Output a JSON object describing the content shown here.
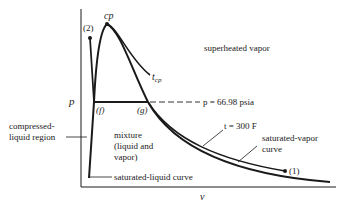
{
  "diagram": {
    "type": "p-v diagram",
    "axes": {
      "y_label": "p",
      "x_label": "v"
    },
    "points": {
      "critical_point": "cp",
      "point_2": "(2)",
      "point_1": "(1)",
      "f": "(f)",
      "g": "(g)"
    },
    "labels": {
      "t_cp_main": "t",
      "t_cp_sub": "cp",
      "superheated": "superheated vapor",
      "pressure_line": "p = 66.98 psia",
      "isotherm": "t = 300 F",
      "sat_vapor_line1": "saturated-vapor",
      "sat_vapor_line2": "curve",
      "compressed_line1": "compressed-",
      "compressed_line2": "liquid region",
      "mixture_line1": "mixture",
      "mixture_line2": "(liquid and",
      "mixture_line3": "vapor)",
      "sat_liquid": "saturated-liquid curve"
    },
    "colors": {
      "ink": "#1a1a1a",
      "background": "#ffffff"
    }
  }
}
